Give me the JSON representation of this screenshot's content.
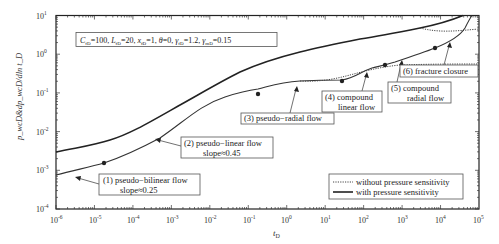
{
  "chart_data": {
    "type": "line",
    "title": "",
    "xlabel": "t_D",
    "ylabel": "p_wcD & dp_wcD/dln t_D",
    "xscale": "log",
    "yscale": "log",
    "xlim": [
      1e-06,
      100000.0
    ],
    "ylim": [
      0.0001,
      10
    ],
    "grid": false,
    "legend_position": "lower right",
    "x_ticks": [
      "10^-6",
      "10^-5",
      "10^-4",
      "10^-3",
      "10^-2",
      "10^-1",
      "10^0",
      "10^1",
      "10^2",
      "10^3",
      "10^4",
      "10^5"
    ],
    "y_ticks": [
      "10^-4",
      "10^-3",
      "10^-2",
      "10^-1",
      "10^0",
      "10^1"
    ],
    "parameters_box": "C_fD=100, L_fD=20, x_fD=1, θ=0, γ_fD=1.2, γ_mD=0.15",
    "series": [
      {
        "name": "pressure (with pressure sensitivity)",
        "style": "solid-thick",
        "x": [
          1e-06,
          1e-05,
          0.0001,
          0.001,
          0.01,
          0.1,
          1,
          10,
          100,
          1000,
          10000.0,
          50000.0
        ],
        "y": [
          0.0028,
          0.0048,
          0.012,
          0.05,
          0.19,
          0.6,
          1.15,
          1.8,
          2.7,
          4.2,
          6.5,
          10
        ]
      },
      {
        "name": "derivative (with pressure sensitivity)",
        "style": "solid",
        "x": [
          1e-06,
          1e-05,
          0.0001,
          0.001,
          0.01,
          0.1,
          1,
          10,
          100,
          1000,
          10000.0,
          30000.0
        ],
        "y": [
          0.0007,
          0.0013,
          0.0045,
          0.022,
          0.06,
          0.1,
          0.16,
          0.2,
          0.35,
          0.6,
          1.3,
          8
        ]
      },
      {
        "name": "derivative (without pressure sensitivity)",
        "style": "dotted",
        "x": [
          0.1,
          1,
          10,
          100,
          1000,
          10000.0,
          100000.0
        ],
        "y": [
          0.1,
          0.16,
          0.18,
          0.27,
          0.42,
          0.48,
          0.5
        ]
      },
      {
        "name": "pressure (without pressure sensitivity)",
        "style": "dotted",
        "x": [
          1000.0,
          10000.0,
          100000.0
        ],
        "y": [
          4.2,
          5.2,
          5.6
        ]
      }
    ],
    "markers": [
      {
        "label": "pseudo-bilinear",
        "x": 1.5e-05,
        "y": 0.0013
      },
      {
        "label": "pseudo-radial",
        "x": 0.15,
        "y": 0.1
      },
      {
        "label": "compound linear",
        "x": 20,
        "y": 0.2
      },
      {
        "label": "compound radial",
        "x": 250,
        "y": 0.5
      },
      {
        "label": "fracture closure",
        "x": 8000,
        "y": 1.3
      }
    ],
    "annotations": [
      {
        "id": 1,
        "text": "(1) pseudo-bilinear flow",
        "sub": "slope≈0.25"
      },
      {
        "id": 2,
        "text": "(2) pseudo-linear flow",
        "sub": "slope≈0.45"
      },
      {
        "id": 3,
        "text": "(3) pseudo-radial flow",
        "sub": ""
      },
      {
        "id": 4,
        "text": "(4) compound",
        "sub": "linear flow"
      },
      {
        "id": 5,
        "text": "(5) compound",
        "sub": "radial flow"
      },
      {
        "id": 6,
        "text": "(6) fracture closure",
        "sub": ""
      }
    ],
    "legend": [
      {
        "label": "without pressure sensitivity",
        "style": "dotted"
      },
      {
        "label": "with pressure sensitivity",
        "style": "solid"
      }
    ]
  },
  "labels": {
    "params": "C",
    "x_axis": "t",
    "x_axis_sub": "D",
    "y_axis": "p_wcD&dp_wcD/dln t_D",
    "ann1a": "(1)  pseudo−bilinear flow",
    "ann1b": "slope≈0.25",
    "ann2a": "(2)  pseudo−linear flow",
    "ann2b": "slope≈0.45",
    "ann3": "(3)  pseudo−radial flow",
    "ann4a": "(4)  compound",
    "ann4b": "linear flow",
    "ann5a": "(5)  compound",
    "ann5b": "radial flow",
    "ann6": "(6)  fracture closure",
    "legend1": "without pressure sensitivity",
    "legend2": "with pressure sensitivity",
    "xt": [
      "-6",
      "-5",
      "-4",
      "-3",
      "-2",
      "-1",
      "0",
      "1",
      "2",
      "3",
      "4",
      "5"
    ],
    "yt": [
      "1",
      "0",
      "-1",
      "-2",
      "-3",
      "-4"
    ]
  },
  "colors": {
    "axis": "#222222",
    "curve": "#333333",
    "box_border": "#555555"
  }
}
